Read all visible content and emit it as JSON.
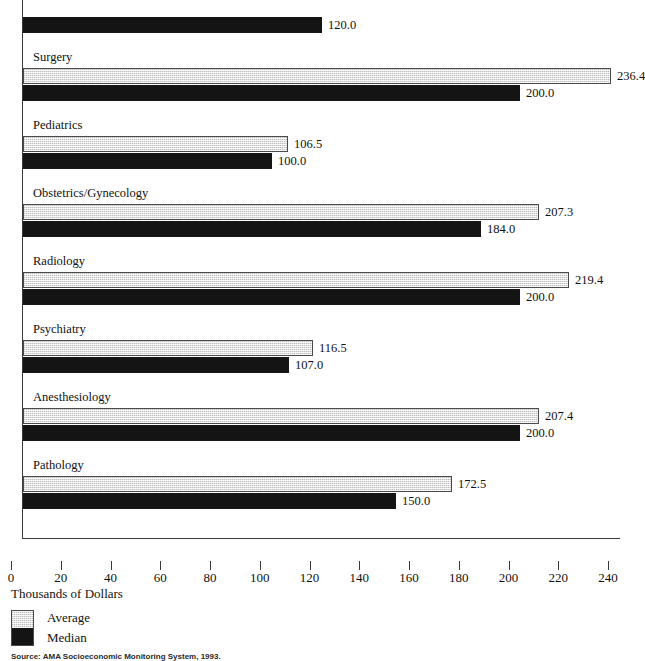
{
  "chart_data": {
    "type": "bar",
    "orientation": "horizontal",
    "title": "",
    "xlabel": "Thousands of Dollars",
    "ylabel": "",
    "xlim": [
      0,
      240
    ],
    "xticks": [
      0,
      20,
      40,
      60,
      80,
      100,
      120,
      140,
      160,
      180,
      200,
      220,
      240
    ],
    "xtick_labels": [
      "0",
      "20",
      "40",
      "60",
      "80",
      "100",
      "120",
      "140",
      "160",
      "180",
      "200",
      "220",
      "240"
    ],
    "grid": false,
    "legend_position": "bottom-left",
    "categories": [
      "",
      "Surgery",
      "Pediatrics",
      "Obstetrics/Gynecology",
      "Radiology",
      "Psychiatry",
      "Anesthesiology",
      "Pathology"
    ],
    "series": [
      {
        "name": "Average",
        "color": "#e3e3e3",
        "values": [
          null,
          236.4,
          106.5,
          207.3,
          219.4,
          116.5,
          207.4,
          172.5
        ],
        "labels": [
          "",
          "236.4",
          "106.5",
          "207.3",
          "219.4",
          "116.5",
          "207.4",
          "172.5"
        ]
      },
      {
        "name": "Median",
        "color": "#141414",
        "values": [
          120.0,
          200.0,
          100.0,
          184.0,
          200.0,
          107.0,
          200.0,
          150.0
        ],
        "labels": [
          "120.0",
          "200.0",
          "100.0",
          "184.0",
          "200.0",
          "107.0",
          "200.0",
          "150.0"
        ]
      }
    ]
  },
  "legend": {
    "items": [
      {
        "label": "Average"
      },
      {
        "label": "Median"
      }
    ]
  },
  "axis": {
    "title": "Thousands of Dollars"
  },
  "footer": {
    "source": "Source: AMA Socioeconomic Monitoring System, 1993."
  }
}
